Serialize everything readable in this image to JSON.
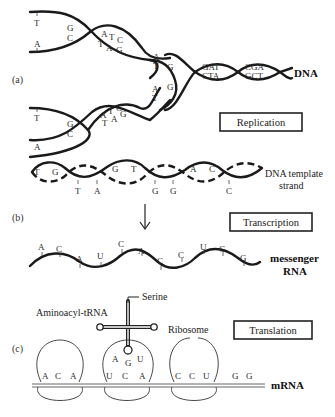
{
  "figure": {
    "panels": [
      {
        "id": "a",
        "label": "(a)",
        "process": "Replication",
        "molecule_label": "DNA",
        "upper_fork_bases": [
          "T",
          "A",
          "G",
          "C",
          "A",
          "T",
          "C",
          "T",
          "A",
          "G",
          "A",
          "T"
        ],
        "lower_fork_bases": [
          "T",
          "A",
          "G",
          "C",
          "A",
          "T",
          "C",
          "T",
          "A",
          "G",
          "A",
          "T"
        ],
        "helix_bases_top": [
          "G",
          "C",
          "GAT",
          "CGA"
        ],
        "helix_bases_bottom": [
          "C",
          "G",
          "CTA",
          "GCT"
        ]
      },
      {
        "id": "b",
        "label": "(b)",
        "process": "Transcription",
        "template_label_line1": "DNA template",
        "template_label_line2": "strand",
        "template_bases_inner": [
          "T",
          "G",
          "G",
          "T",
          "A",
          "C"
        ],
        "template_bases_outer": [
          "T",
          "A",
          "G",
          "G",
          "C"
        ],
        "mrna_label_line1": "messenger",
        "mrna_label_line2": "RNA",
        "mrna_bases": [
          "A",
          "C",
          "A",
          "U",
          "C",
          "A",
          "C",
          "C",
          "U",
          "G",
          "G"
        ]
      },
      {
        "id": "c",
        "label": "(c)",
        "process": "Translation",
        "trna_label": "Aminoacyl-tRNA",
        "amino_acid_label": "Serine",
        "ribosome_label": "Ribosome",
        "anticodon": [
          "A",
          "G",
          "U"
        ],
        "codons": [
          [
            "A",
            "C",
            "A"
          ],
          [
            "U",
            "C",
            "A"
          ],
          [
            "C",
            "C",
            "U"
          ]
        ],
        "trailing_bases": [
          "G",
          "G"
        ],
        "mrna_label": "mRNA"
      }
    ]
  }
}
